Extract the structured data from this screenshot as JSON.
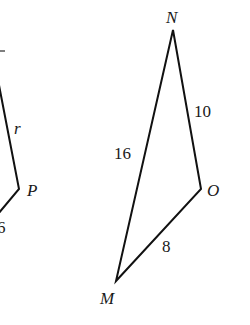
{
  "figure": {
    "left_shape": {
      "vertices": [
        {
          "name": "P",
          "label": "P",
          "x": 19,
          "y": 189
        }
      ],
      "edge_labels": {
        "upper_edge": "r",
        "lower_edge": "6"
      },
      "partial_top_mark": "‾"
    },
    "triangle": {
      "vertices": {
        "N": {
          "label": "N",
          "x": 173,
          "y": 30
        },
        "O": {
          "label": "O",
          "x": 201,
          "y": 189
        },
        "M": {
          "label": "M",
          "x": 116,
          "y": 281
        }
      },
      "edges": {
        "MN": "16",
        "NO": "10",
        "MO": "8"
      }
    },
    "colors": {
      "line": "#111111",
      "text": "#1a1a1a",
      "background": "#ffffff"
    }
  }
}
